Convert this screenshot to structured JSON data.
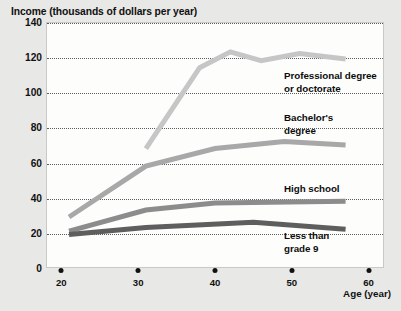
{
  "chart_data": {
    "type": "line",
    "title": "Income (thousands of dollars per year)",
    "xlabel": "Age (year)",
    "ylabel": "Income (thousands of dollars per year)",
    "xlim": [
      18,
      62
    ],
    "ylim": [
      0,
      140
    ],
    "xticks": [
      20,
      30,
      40,
      50,
      60
    ],
    "yticks": [
      0,
      20,
      40,
      60,
      80,
      100,
      120,
      140
    ],
    "grid": "horizontal-dotted",
    "legend_position": "inline-annotations",
    "series": [
      {
        "name": "Professional degree or doctorate",
        "color": "#c6c6c6",
        "x": [
          31,
          38,
          42,
          46,
          51,
          57
        ],
        "values": [
          68,
          114,
          123,
          118,
          122,
          119
        ]
      },
      {
        "name": "Bachelor's degree",
        "color": "#a8a8a8",
        "x": [
          21,
          31,
          40,
          49,
          57
        ],
        "values": [
          29,
          58,
          68,
          72,
          70
        ]
      },
      {
        "name": "High school",
        "color": "#8c8c8c",
        "x": [
          21,
          31,
          40,
          57
        ],
        "values": [
          21,
          33,
          37,
          38
        ]
      },
      {
        "name": "Less than grade 9",
        "color": "#5e5e5e",
        "x": [
          21,
          31,
          45,
          57
        ],
        "values": [
          19,
          23,
          26,
          22
        ]
      }
    ]
  },
  "axes": {
    "y_tick_labels": [
      "140",
      "120",
      "100",
      "80",
      "60",
      "40",
      "20",
      "0"
    ],
    "x_tick_labels": [
      "20",
      "30",
      "40",
      "50",
      "60"
    ],
    "x_title": "Age (year)",
    "y_title": "Income (thousands of dollars per year)"
  },
  "annotations": [
    {
      "id": "professional",
      "text": "Professional degree\nor doctorate"
    },
    {
      "id": "bachelors",
      "text": "Bachelor's\ndegree"
    },
    {
      "id": "highschool",
      "text": "High school"
    },
    {
      "id": "lessthan9",
      "text": "Less than\ngrade 9"
    }
  ]
}
